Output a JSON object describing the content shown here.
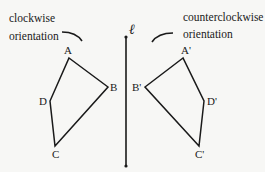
{
  "diagram": {
    "line": {
      "label": "ℓ",
      "x": 126,
      "y1": 37,
      "y2": 166
    },
    "left_caption": {
      "line1": "clockwise",
      "line2": "orientation"
    },
    "right_caption": {
      "line1": "counterclockwise",
      "line2": "orientation"
    },
    "original": {
      "vertices": [
        {
          "name": "A",
          "x": 69,
          "y": 58
        },
        {
          "name": "B",
          "x": 108,
          "y": 87
        },
        {
          "name": "C",
          "x": 55,
          "y": 146
        },
        {
          "name": "D",
          "x": 50,
          "y": 101
        }
      ]
    },
    "image": {
      "vertices": [
        {
          "name": "A'",
          "x": 183,
          "y": 58
        },
        {
          "name": "B'",
          "x": 145,
          "y": 87
        },
        {
          "name": "C'",
          "x": 199,
          "y": 146
        },
        {
          "name": "D'",
          "x": 204,
          "y": 101
        }
      ]
    },
    "colors": {
      "stroke": "#1a1a1a",
      "background": "#f7f7f5"
    }
  }
}
